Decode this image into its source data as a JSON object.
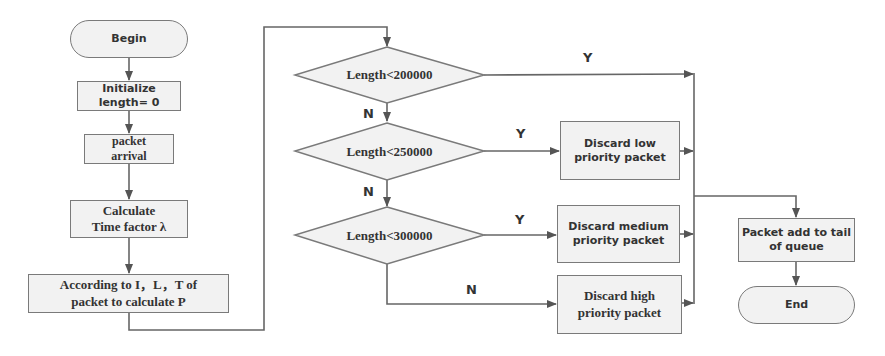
{
  "flowchart": {
    "nodes": {
      "begin": "Begin",
      "initialize_line1": "Initialize",
      "initialize_line2": "length= 0",
      "arrival_line1": "packet",
      "arrival_line2": "arrival",
      "calc_line1": "Calculate",
      "calc_line2": "Time factor λ",
      "according_line1": "According to I，L，T of",
      "according_line2": "packet to calculate P",
      "decision1": "Length<200000",
      "decision2": "Length<250000",
      "decision3": "Length<300000",
      "discard_low_line1": "Discard low",
      "discard_low_line2": "priority packet",
      "discard_medium_line1": "Discard medium",
      "discard_medium_line2": "priority packet",
      "discard_high_line1": "Discard high",
      "discard_high_line2": "priority packet",
      "add_tail_line1": "Packet add to tail",
      "add_tail_line2": "of queue",
      "end": "End"
    },
    "edge_labels": {
      "d1_yes": "Y",
      "d1_no": "N",
      "d2_yes": "Y",
      "d2_no": "N",
      "d3_yes": "Y",
      "d3_no": "N"
    },
    "colors": {
      "line": "#666666",
      "fill": "#f2f2f2",
      "text": "#333333"
    }
  }
}
